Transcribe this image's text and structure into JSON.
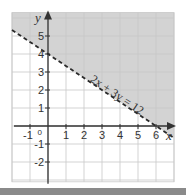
{
  "chart_data": {
    "type": "line",
    "title": "",
    "xlabel": "x",
    "ylabel": "y",
    "xlim": [
      -2,
      7
    ],
    "ylim": [
      -3.1,
      6.3
    ],
    "grid": true,
    "x_ticks": [
      -1,
      1,
      2,
      3,
      4,
      5,
      6
    ],
    "x_tick_labels": [
      "-1",
      "1",
      "2",
      "3",
      "4",
      "5",
      "6"
    ],
    "y_ticks": [
      -2,
      -1,
      1,
      2,
      3,
      4,
      5
    ],
    "y_tick_labels": [
      "-2",
      "-1",
      "1",
      "2",
      "3",
      "4",
      "5"
    ],
    "origin_label": "0",
    "series": [
      {
        "name": "2x + 3y = 12",
        "style": "dashed",
        "x": [
          -2,
          7
        ],
        "y": [
          5.3333,
          -0.6667
        ]
      }
    ],
    "shaded_region": {
      "inequality": "2x + 3y > 12",
      "side": "above line",
      "color": "#d3d3d3"
    },
    "annotations": [
      {
        "text": "2x + 3y = 12",
        "x": 2.3,
        "y": 2.5,
        "rotation_along_line": true
      }
    ],
    "colors": {
      "grid": "#c8c8c8",
      "axis": "#333333",
      "shade": "#d3d3d3",
      "line": "#2a2a2a"
    }
  }
}
